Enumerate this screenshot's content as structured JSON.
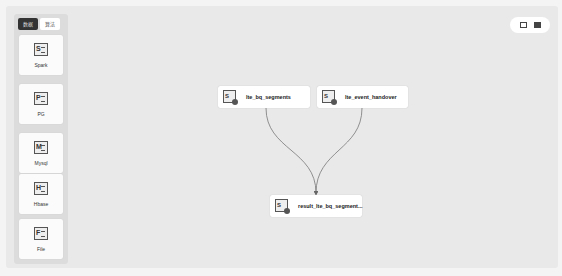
{
  "palette": {
    "tabs": [
      {
        "label": "数据",
        "active": true
      },
      {
        "label": "算法",
        "active": false
      }
    ],
    "items": [
      {
        "letter": "S",
        "label": "Spark"
      },
      {
        "letter": "P",
        "label": "PG"
      },
      {
        "letter": "M",
        "label": "Mysql"
      },
      {
        "letter": "H",
        "label": "Hbase"
      },
      {
        "letter": "F",
        "label": "File"
      }
    ]
  },
  "toolbar": {
    "icons": [
      "fit-view-icon",
      "minimap-icon"
    ]
  },
  "nodes": [
    {
      "id": "n1",
      "letter": "S",
      "label": "lte_bq_segments"
    },
    {
      "id": "n2",
      "letter": "S",
      "label": "lte_event_handover"
    },
    {
      "id": "n3",
      "letter": "S",
      "label": "result_lte_bq_segment..."
    }
  ],
  "edges": [
    {
      "from": "n1",
      "to": "n3"
    },
    {
      "from": "n2",
      "to": "n3"
    }
  ],
  "colors": {
    "canvas": "#e9e9e9",
    "edge": "#666666",
    "tab_active": "#333333"
  }
}
